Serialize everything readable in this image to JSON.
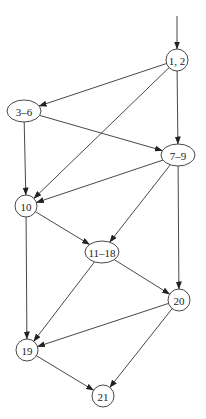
{
  "diagram": {
    "type": "control-flow-graph",
    "colors": {
      "stroke": "#333333",
      "background": "#ffffff",
      "text": "#222222"
    },
    "entry": {
      "x": 177,
      "y": 16
    },
    "nodes": [
      {
        "id": "n12",
        "label": "1, 2",
        "shape": "circle",
        "x": 177,
        "y": 60,
        "rx": 11,
        "ry": 11
      },
      {
        "id": "n36",
        "label": "3–6",
        "shape": "ellipse",
        "x": 24,
        "y": 111,
        "rx": 17,
        "ry": 11
      },
      {
        "id": "n79",
        "label": "7–9",
        "shape": "ellipse",
        "x": 178,
        "y": 155,
        "rx": 17,
        "ry": 11
      },
      {
        "id": "n10",
        "label": "10",
        "shape": "circle",
        "x": 26,
        "y": 206,
        "rx": 11,
        "ry": 11
      },
      {
        "id": "n1118",
        "label": "11–18",
        "shape": "ellipse",
        "x": 102,
        "y": 252,
        "rx": 17,
        "ry": 11
      },
      {
        "id": "n20",
        "label": "20",
        "shape": "circle",
        "x": 179,
        "y": 300,
        "rx": 11,
        "ry": 11
      },
      {
        "id": "n19",
        "label": "19",
        "shape": "circle",
        "x": 27,
        "y": 350,
        "rx": 11,
        "ry": 11
      },
      {
        "id": "n21",
        "label": "21",
        "shape": "circle",
        "x": 103,
        "y": 396,
        "rx": 11,
        "ry": 11
      }
    ],
    "edges": [
      {
        "from": "entry",
        "to": "n12"
      },
      {
        "from": "n12",
        "to": "n36"
      },
      {
        "from": "n12",
        "to": "n10"
      },
      {
        "from": "n12",
        "to": "n79"
      },
      {
        "from": "n36",
        "to": "n10"
      },
      {
        "from": "n36",
        "to": "n79"
      },
      {
        "from": "n79",
        "to": "n10"
      },
      {
        "from": "n79",
        "to": "n1118"
      },
      {
        "from": "n79",
        "to": "n20"
      },
      {
        "from": "n10",
        "to": "n1118"
      },
      {
        "from": "n10",
        "to": "n19"
      },
      {
        "from": "n1118",
        "to": "n19"
      },
      {
        "from": "n1118",
        "to": "n20"
      },
      {
        "from": "n20",
        "to": "n19"
      },
      {
        "from": "n20",
        "to": "n21"
      },
      {
        "from": "n19",
        "to": "n21"
      }
    ]
  }
}
